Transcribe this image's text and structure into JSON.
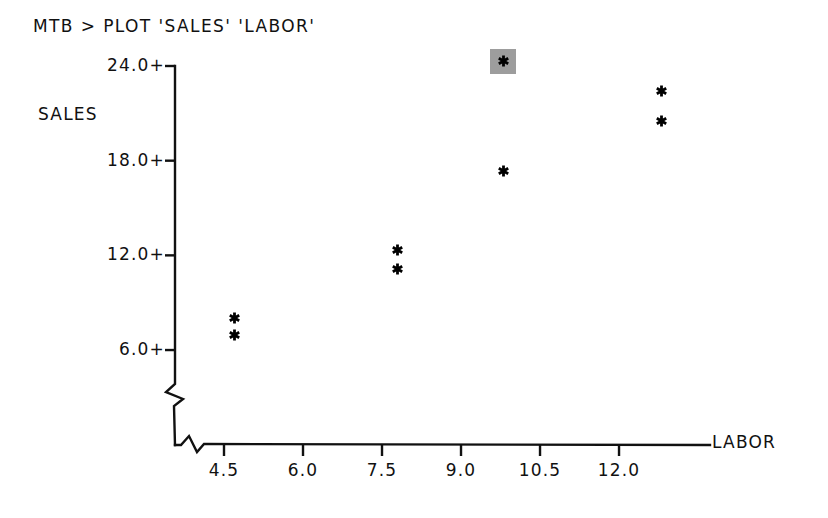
{
  "session": {
    "prompt": "MTB >",
    "command": "MTB > PLOT 'SALES' 'LABOR'"
  },
  "chart_data": {
    "type": "scatter",
    "title": "",
    "subtitle": "",
    "xlabel": "LABOR",
    "ylabel": "SALES",
    "marker": "*",
    "grid": false,
    "legend": false,
    "axis_break_x": true,
    "axis_break_y": true,
    "xlim": [
      3.75,
      13.2
    ],
    "ylim": [
      4.5,
      25.0
    ],
    "xticks": [
      "4.5",
      "6.0",
      "7.5",
      "9.0",
      "10.5",
      "12.0"
    ],
    "xtick_values": [
      4.5,
      6.0,
      7.5,
      9.0,
      10.5,
      12.0
    ],
    "yticks": [
      "24.0+",
      "18.0+",
      "12.0+",
      "6.0+"
    ],
    "ytick_values": [
      24.0,
      18.0,
      12.0,
      6.0
    ],
    "points": [
      {
        "x": 4.7,
        "y": 8.0,
        "highlighted": false
      },
      {
        "x": 4.7,
        "y": 6.9,
        "highlighted": false
      },
      {
        "x": 7.8,
        "y": 12.3,
        "highlighted": false
      },
      {
        "x": 7.8,
        "y": 11.1,
        "highlighted": false
      },
      {
        "x": 9.8,
        "y": 24.3,
        "highlighted": true
      },
      {
        "x": 9.8,
        "y": 17.3,
        "highlighted": false
      },
      {
        "x": 12.8,
        "y": 22.4,
        "highlighted": false
      },
      {
        "x": 12.8,
        "y": 20.5,
        "highlighted": false
      }
    ],
    "colors": {
      "axis": "#111111",
      "marker": "#000000",
      "highlight": "#9d9d9d",
      "background": "#ffffff"
    }
  },
  "geometry": {
    "origin_x": 175,
    "origin_y": 445,
    "y_axis_top": 66,
    "x_axis_right": 710,
    "x_px_per_unit": 52.67,
    "x_ref_value": 4.5,
    "x_ref_px": 224,
    "y_px_per_unit": 15.78,
    "y_ref_value": 24.0,
    "y_ref_px": 66
  }
}
